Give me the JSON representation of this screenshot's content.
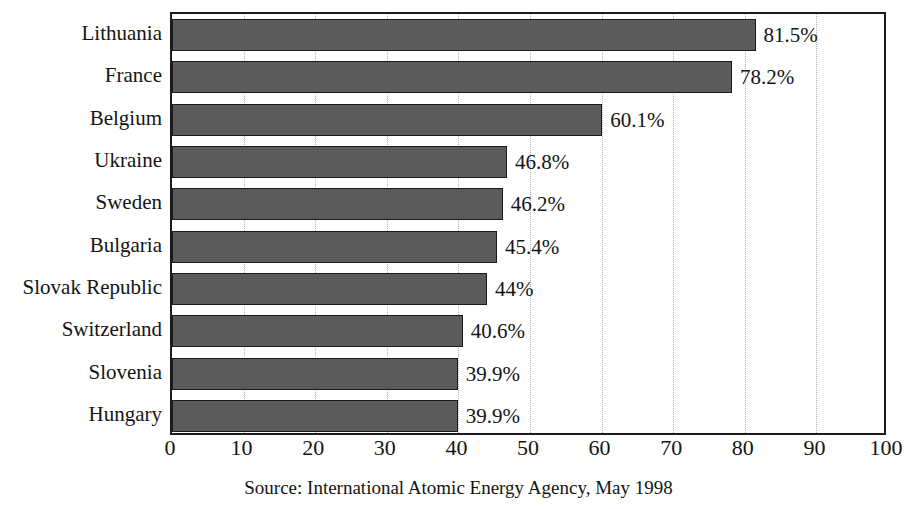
{
  "chart_data": {
    "type": "bar",
    "orientation": "horizontal",
    "title": "",
    "subtitle": "",
    "xlabel": "",
    "ylabel": "",
    "xlim": [
      0,
      100
    ],
    "xticks": [
      0,
      10,
      20,
      30,
      40,
      50,
      60,
      70,
      80,
      90,
      100
    ],
    "xtick_labels": [
      "0",
      "10",
      "20",
      "30",
      "40",
      "50",
      "60",
      "70",
      "80",
      "90",
      "100"
    ],
    "grid": true,
    "grid_axis": "x",
    "grid_style": "dotted",
    "legend": false,
    "legend_position": "none",
    "categories": [
      "Lithuania",
      "France",
      "Belgium",
      "Ukraine",
      "Sweden",
      "Bulgaria",
      "Slovak Republic",
      "Switzerland",
      "Slovenia",
      "Hungary"
    ],
    "values": [
      81.5,
      78.2,
      60.1,
      46.8,
      46.2,
      45.4,
      44,
      40.6,
      39.9,
      39.9
    ],
    "value_labels": [
      "81.5%",
      "78.2%",
      "60.1%",
      "46.8%",
      "46.2%",
      "45.4%",
      "44%",
      "40.6%",
      "39.9%",
      "39.9%"
    ],
    "bar_color": "#5b5b5b",
    "bar_edge_color": "#1b1b1b",
    "plot_border_color": "#1b1b1b",
    "gridline_color": "#b4b4b4",
    "background_color": "#ffffff"
  },
  "source": {
    "text": "Source: International Atomic Energy Agency, May 1998"
  }
}
